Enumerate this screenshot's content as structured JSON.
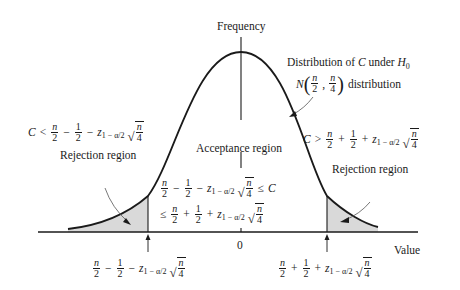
{
  "diagram": {
    "y_axis_label": "Frequency",
    "x_axis_label": "Value",
    "origin_tick_label": "0",
    "distribution_label_line1_text": "Distribution of",
    "distribution_label_var": "C",
    "distribution_label_under": "under",
    "distribution_label_hyp": "H",
    "distribution_label_hyp_sub": "0",
    "distribution_label_line2_N": "N",
    "distribution_label_line2_suffix": "distribution",
    "acceptance_label": "Acceptance region",
    "left_rejection_label": "Rejection region",
    "right_rejection_label": "Rejection region",
    "math": {
      "C": "C",
      "n": "n",
      "two": "2",
      "one": "1",
      "four": "4",
      "z": "z",
      "z_sub": "1 − α/2",
      "lt": "<",
      "gt": ">",
      "le": "≤",
      "minus": "−",
      "plus": "+",
      "comma": ","
    },
    "left_cutoff_expression": "n/2 − 1/2 − z_{1−α/2} √(n/4)",
    "right_cutoff_expression": "n/2 + 1/2 + z_{1−α/2} √(n/4)",
    "left_rejection_condition": "C < n/2 − 1/2 − z_{1−α/2} √(n/4)",
    "right_rejection_condition": "C > n/2 + 1/2 + z_{1−α/2} √(n/4)",
    "acceptance_condition": "n/2 − 1/2 − z_{1−α/2} √(n/4) ≤ C ≤ n/2 + 1/2 + z_{1−α/2} √(n/4)",
    "distribution_params": "N(n/2, n/4)",
    "colors": {
      "line": "#1a1a1a",
      "shade": "#d9d9d9",
      "arrow": "#555555"
    }
  }
}
